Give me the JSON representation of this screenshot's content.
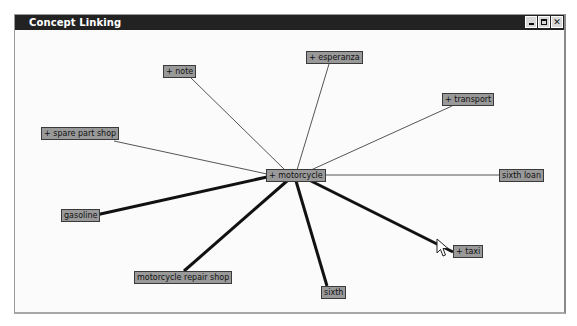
{
  "window": {
    "title": "Concept Linking",
    "controls": {
      "minimize": "minimize",
      "maximize": "maximize",
      "close": "close",
      "close_glyph": "✕"
    }
  },
  "graph": {
    "center": "motorcycle",
    "nodes": [
      {
        "id": "motorcycle",
        "label": "+ motorcycle",
        "expandable": true
      },
      {
        "id": "note",
        "label": "+ note",
        "expandable": true
      },
      {
        "id": "esperanza",
        "label": "+ esperanza",
        "expandable": true
      },
      {
        "id": "transport",
        "label": "+ transport",
        "expandable": true
      },
      {
        "id": "spare_part_shop",
        "label": "+ spare part shop",
        "expandable": true
      },
      {
        "id": "sixth_loan",
        "label": "sixth loan",
        "expandable": false
      },
      {
        "id": "gasoline",
        "label": "gasoline",
        "expandable": false
      },
      {
        "id": "taxi",
        "label": "+ taxi",
        "expandable": true
      },
      {
        "id": "motorcycle_repair_shop",
        "label": "motorcycle repair shop",
        "expandable": false
      },
      {
        "id": "sixth",
        "label": "sixth",
        "expandable": false
      }
    ],
    "edges": [
      {
        "from": "motorcycle",
        "to": "note",
        "strength": "weak"
      },
      {
        "from": "motorcycle",
        "to": "esperanza",
        "strength": "weak"
      },
      {
        "from": "motorcycle",
        "to": "transport",
        "strength": "weak"
      },
      {
        "from": "motorcycle",
        "to": "spare_part_shop",
        "strength": "weak"
      },
      {
        "from": "motorcycle",
        "to": "sixth_loan",
        "strength": "weak"
      },
      {
        "from": "motorcycle",
        "to": "gasoline",
        "strength": "strong"
      },
      {
        "from": "motorcycle",
        "to": "taxi",
        "strength": "strong"
      },
      {
        "from": "motorcycle",
        "to": "motorcycle_repair_shop",
        "strength": "strong"
      },
      {
        "from": "motorcycle",
        "to": "sixth",
        "strength": "strong"
      }
    ]
  },
  "colors": {
    "titlebar": "#222222",
    "node_fill": "#999999",
    "node_border": "#3a3a3a",
    "weak_edge": "#555555",
    "strong_edge": "#111111"
  }
}
